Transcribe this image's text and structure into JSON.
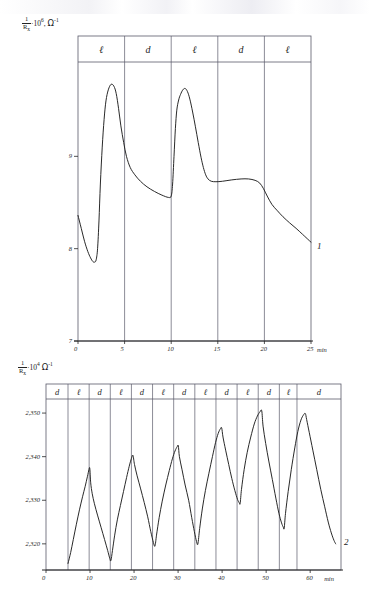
{
  "figure": {
    "curve_labels": {
      "top": "1",
      "bottom": "2"
    }
  },
  "chart_data": [
    {
      "id": "top",
      "type": "line",
      "title": "",
      "ylabel": "1/Rx · 10^6 , Ω^-1",
      "ylabel_parts": {
        "num": "1",
        "den": "R",
        "den_sub": "x",
        "mult": "·10",
        "exp": "6",
        "comma": ",",
        "omega": "Ω",
        "omega_exp": "-1"
      },
      "xlabel": "min",
      "xlim": [
        0,
        25
      ],
      "ylim": [
        7,
        10
      ],
      "xticks": [
        0,
        5,
        10,
        15,
        20,
        25
      ],
      "xticklabels": [
        "0",
        "5",
        "10",
        "15",
        "20",
        "25"
      ],
      "yticks": [
        7,
        8,
        9
      ],
      "yticklabels": [
        "7",
        "8",
        "9"
      ],
      "grid": "vertical-only",
      "legend": "none",
      "series_label": "1",
      "bands": [
        {
          "label": "ℓ",
          "from": 0,
          "to": 5
        },
        {
          "label": "d",
          "from": 5,
          "to": 10
        },
        {
          "label": "ℓ",
          "from": 10,
          "to": 15
        },
        {
          "label": "d",
          "from": 15,
          "to": 20
        },
        {
          "label": "ℓ",
          "from": 20,
          "to": 25
        }
      ],
      "points": [
        [
          0.0,
          8.36
        ],
        [
          0.35,
          8.22
        ],
        [
          0.7,
          8.08
        ],
        [
          1.05,
          7.97
        ],
        [
          1.35,
          7.9
        ],
        [
          1.6,
          7.86
        ],
        [
          1.8,
          7.855
        ],
        [
          1.95,
          7.88
        ],
        [
          2.1,
          8.0
        ],
        [
          2.25,
          8.3
        ],
        [
          2.4,
          8.7
        ],
        [
          2.6,
          9.1
        ],
        [
          2.8,
          9.4
        ],
        [
          3.0,
          9.6
        ],
        [
          3.25,
          9.72
        ],
        [
          3.55,
          9.78
        ],
        [
          3.85,
          9.76
        ],
        [
          4.1,
          9.68
        ],
        [
          4.35,
          9.52
        ],
        [
          4.6,
          9.33
        ],
        [
          4.9,
          9.15
        ],
        [
          5.2,
          9.0
        ],
        [
          5.6,
          8.88
        ],
        [
          6.1,
          8.8
        ],
        [
          6.7,
          8.73
        ],
        [
          7.4,
          8.67
        ],
        [
          8.2,
          8.62
        ],
        [
          9.0,
          8.58
        ],
        [
          9.7,
          8.555
        ],
        [
          10.0,
          8.57
        ],
        [
          10.15,
          8.7
        ],
        [
          10.3,
          9.0
        ],
        [
          10.45,
          9.3
        ],
        [
          10.6,
          9.5
        ],
        [
          10.8,
          9.61
        ],
        [
          11.0,
          9.67
        ],
        [
          11.25,
          9.72
        ],
        [
          11.5,
          9.735
        ],
        [
          11.75,
          9.7
        ],
        [
          12.0,
          9.62
        ],
        [
          12.3,
          9.48
        ],
        [
          12.6,
          9.32
        ],
        [
          12.9,
          9.15
        ],
        [
          13.2,
          8.99
        ],
        [
          13.45,
          8.88
        ],
        [
          13.7,
          8.8
        ],
        [
          13.95,
          8.755
        ],
        [
          14.3,
          8.73
        ],
        [
          14.8,
          8.725
        ],
        [
          15.5,
          8.73
        ],
        [
          16.5,
          8.745
        ],
        [
          17.5,
          8.755
        ],
        [
          18.3,
          8.755
        ],
        [
          19.0,
          8.74
        ],
        [
          19.5,
          8.71
        ],
        [
          19.9,
          8.65
        ],
        [
          20.3,
          8.57
        ],
        [
          20.8,
          8.48
        ],
        [
          21.4,
          8.41
        ],
        [
          22.0,
          8.345
        ],
        [
          22.7,
          8.28
        ],
        [
          23.4,
          8.22
        ],
        [
          24.1,
          8.155
        ],
        [
          25.0,
          8.07
        ]
      ]
    },
    {
      "id": "bottom",
      "type": "line",
      "title": "",
      "ylabel": "1/Rx · 10^4 , Ω^-1",
      "ylabel_parts": {
        "num": "1",
        "den": "R",
        "den_sub": "x",
        "mult": "·10",
        "exp": "4",
        "comma": "",
        "omega": "Ω",
        "omega_exp": "-1"
      },
      "xlabel": "min",
      "xlim": [
        0,
        67
      ],
      "ylim": [
        2314,
        2353
      ],
      "xticks": [
        0,
        10,
        20,
        30,
        40,
        50,
        60
      ],
      "xticklabels": [
        "0",
        "10",
        "20",
        "30",
        "40",
        "50",
        "60"
      ],
      "yticks": [
        2320,
        2330,
        2340,
        2350
      ],
      "yticklabels": [
        "2,320",
        "2,330",
        "2,340",
        "2,350"
      ],
      "grid": "vertical-only",
      "legend": "none",
      "series_label": "2",
      "bands": [
        {
          "label": "d",
          "from": 0,
          "to": 5.0
        },
        {
          "label": "ℓ",
          "from": 5.0,
          "to": 9.8
        },
        {
          "label": "d",
          "from": 9.8,
          "to": 14.6
        },
        {
          "label": "ℓ",
          "from": 14.6,
          "to": 19.4
        },
        {
          "label": "d",
          "from": 19.4,
          "to": 24.2
        },
        {
          "label": "ℓ",
          "from": 24.2,
          "to": 29.0
        },
        {
          "label": "d",
          "from": 29.0,
          "to": 33.8
        },
        {
          "label": "ℓ",
          "from": 33.8,
          "to": 38.6
        },
        {
          "label": "d",
          "from": 38.6,
          "to": 43.4
        },
        {
          "label": "ℓ",
          "from": 43.4,
          "to": 48.2
        },
        {
          "label": "d",
          "from": 48.2,
          "to": 53.0
        },
        {
          "label": "ℓ",
          "from": 53.0,
          "to": 57.0
        },
        {
          "label": "d",
          "from": 57.0,
          "to": 67.0
        }
      ],
      "points": [
        [
          5.0,
          2315.5
        ],
        [
          5.6,
          2318.0
        ],
        [
          6.2,
          2321.0
        ],
        [
          6.9,
          2324.5
        ],
        [
          7.6,
          2327.8
        ],
        [
          8.3,
          2330.8
        ],
        [
          8.9,
          2333.2
        ],
        [
          9.4,
          2335.4
        ],
        [
          9.75,
          2337.0
        ],
        [
          9.95,
          2337.3
        ],
        [
          10.15,
          2334.0
        ],
        [
          10.5,
          2331.5
        ],
        [
          11.0,
          2329.2
        ],
        [
          11.7,
          2326.6
        ],
        [
          12.5,
          2323.8
        ],
        [
          13.3,
          2321.0
        ],
        [
          14.0,
          2318.5
        ],
        [
          14.5,
          2316.6
        ],
        [
          14.75,
          2316.2
        ],
        [
          15.1,
          2318.5
        ],
        [
          15.6,
          2322.0
        ],
        [
          16.2,
          2325.5
        ],
        [
          16.9,
          2328.8
        ],
        [
          17.6,
          2332.0
        ],
        [
          18.3,
          2335.2
        ],
        [
          18.9,
          2337.8
        ],
        [
          19.4,
          2339.6
        ],
        [
          19.75,
          2340.3
        ],
        [
          20.1,
          2338.2
        ],
        [
          20.7,
          2335.6
        ],
        [
          21.5,
          2332.6
        ],
        [
          22.3,
          2329.5
        ],
        [
          23.1,
          2326.2
        ],
        [
          23.8,
          2322.8
        ],
        [
          24.4,
          2320.3
        ],
        [
          24.75,
          2319.5
        ],
        [
          25.1,
          2322.0
        ],
        [
          25.7,
          2326.0
        ],
        [
          26.4,
          2329.8
        ],
        [
          27.2,
          2333.5
        ],
        [
          28.0,
          2336.8
        ],
        [
          28.7,
          2339.5
        ],
        [
          29.3,
          2341.3
        ],
        [
          29.8,
          2342.3
        ],
        [
          30.05,
          2342.5
        ],
        [
          30.3,
          2340.0
        ],
        [
          30.9,
          2337.0
        ],
        [
          31.6,
          2333.5
        ],
        [
          32.4,
          2330.0
        ],
        [
          33.1,
          2326.0
        ],
        [
          33.7,
          2322.8
        ],
        [
          34.2,
          2320.5
        ],
        [
          34.5,
          2320.0
        ],
        [
          34.9,
          2323.5
        ],
        [
          35.5,
          2328.0
        ],
        [
          36.2,
          2332.2
        ],
        [
          37.0,
          2336.2
        ],
        [
          37.8,
          2340.0
        ],
        [
          38.5,
          2343.2
        ],
        [
          39.1,
          2345.3
        ],
        [
          39.6,
          2346.4
        ],
        [
          39.9,
          2346.6
        ],
        [
          40.2,
          2344.5
        ],
        [
          40.8,
          2341.5
        ],
        [
          41.5,
          2338.2
        ],
        [
          42.2,
          2335.0
        ],
        [
          42.9,
          2332.2
        ],
        [
          43.5,
          2330.2
        ],
        [
          43.9,
          2329.4
        ],
        [
          44.1,
          2329.3
        ],
        [
          44.4,
          2332.5
        ],
        [
          45.0,
          2337.0
        ],
        [
          45.7,
          2341.0
        ],
        [
          46.5,
          2344.5
        ],
        [
          47.3,
          2347.5
        ],
        [
          48.0,
          2349.3
        ],
        [
          48.6,
          2350.3
        ],
        [
          49.0,
          2350.5
        ],
        [
          49.3,
          2347.0
        ],
        [
          49.9,
          2343.0
        ],
        [
          50.6,
          2339.0
        ],
        [
          51.4,
          2334.8
        ],
        [
          52.2,
          2330.5
        ],
        [
          52.9,
          2327.0
        ],
        [
          53.5,
          2324.8
        ],
        [
          53.9,
          2323.8
        ],
        [
          54.1,
          2323.6
        ],
        [
          54.4,
          2327.0
        ],
        [
          55.0,
          2332.0
        ],
        [
          55.7,
          2337.0
        ],
        [
          56.5,
          2342.0
        ],
        [
          57.2,
          2345.8
        ],
        [
          57.9,
          2348.4
        ],
        [
          58.5,
          2349.6
        ],
        [
          58.9,
          2349.9
        ],
        [
          59.2,
          2348.5
        ],
        [
          59.8,
          2345.5
        ],
        [
          60.6,
          2341.5
        ],
        [
          61.5,
          2337.0
        ],
        [
          62.4,
          2332.5
        ],
        [
          63.3,
          2328.5
        ],
        [
          64.1,
          2325.0
        ],
        [
          64.8,
          2322.5
        ],
        [
          65.4,
          2320.8
        ],
        [
          65.8,
          2320.0
        ]
      ]
    }
  ]
}
